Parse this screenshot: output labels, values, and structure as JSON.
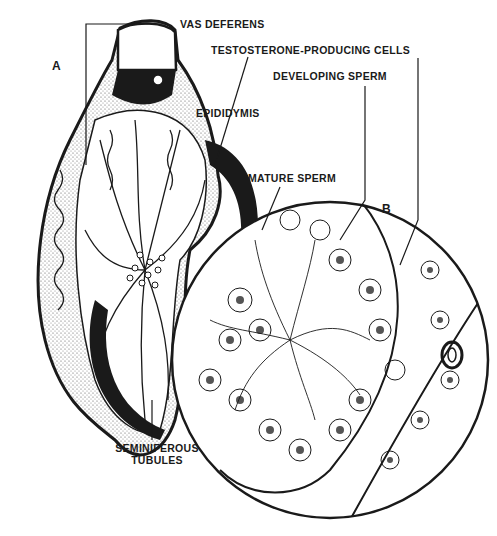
{
  "diagram": {
    "panel_labels": {
      "a": "A",
      "b": "B"
    },
    "labels": {
      "vas_deferens": "VAS DEFERENS",
      "testosterone_cells": "TESTOSTERONE-PRODUCING CELLS",
      "developing_sperm": "DEVELOPING SPERM",
      "epididymis": "EPIDIDYMIS",
      "mature_sperm": "MATURE SPERM",
      "seminiferous_line1": "SEMINIFEROUS",
      "seminiferous_line2": "TUBULES"
    },
    "colors": {
      "ink": "#1a1a1a",
      "paper": "#ffffff",
      "stipple": "#bdbdbd"
    }
  }
}
